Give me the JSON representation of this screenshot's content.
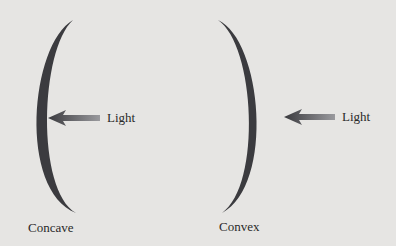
{
  "diagram": {
    "mirrors": [
      {
        "label": "Concave",
        "light_label": "Light"
      },
      {
        "label": "Convex",
        "light_label": "Light"
      }
    ],
    "colors": {
      "background": "#e6e5e3",
      "mirror": "#3b3b3f",
      "arrow_dark": "#3a3a3e",
      "arrow_light": "#8a8a8e",
      "text": "#2a2a2a"
    }
  }
}
